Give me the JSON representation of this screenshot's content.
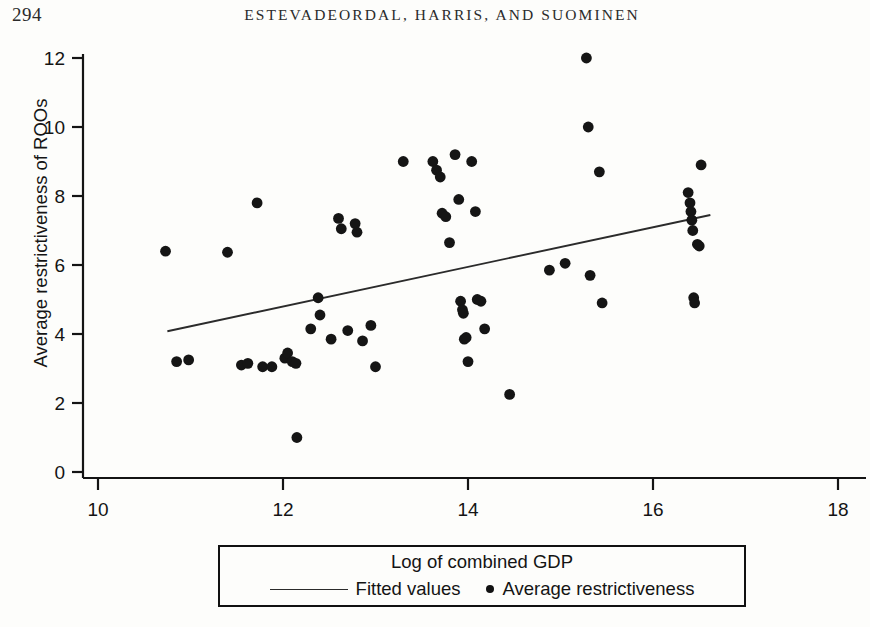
{
  "header": {
    "folio": "294",
    "running_title": "ESTEVADEORDAL, HARRIS, AND SUOMINEN"
  },
  "legend": {
    "title": "Log of combined GDP",
    "fitted_label": "Fitted values",
    "points_label": "Average restrictiveness"
  },
  "axes": {
    "y_title": "Average restrictiveness of ROOs"
  },
  "colors": {
    "ink": "#141414",
    "marker": "#151515",
    "line": "#2b2b2b",
    "background": "#fdfdfb"
  },
  "chart_data": {
    "type": "scatter",
    "title": "",
    "xlabel": "Log of combined GDP",
    "ylabel": "Average restrictiveness of ROOs",
    "xlim": [
      10,
      18
    ],
    "ylim": [
      0,
      12
    ],
    "xticks": [
      10,
      12,
      14,
      16,
      18
    ],
    "yticks": [
      0,
      2,
      4,
      6,
      8,
      10,
      12
    ],
    "grid": false,
    "legend_position": "below-axes",
    "series": [
      {
        "name": "Average restrictiveness",
        "type": "scatter",
        "marker": "circle",
        "points": [
          [
            10.73,
            6.4
          ],
          [
            10.85,
            3.2
          ],
          [
            10.98,
            3.25
          ],
          [
            11.4,
            6.37
          ],
          [
            11.55,
            3.1
          ],
          [
            11.62,
            3.15
          ],
          [
            11.72,
            7.8
          ],
          [
            11.78,
            3.05
          ],
          [
            11.88,
            3.05
          ],
          [
            12.02,
            3.3
          ],
          [
            12.05,
            3.45
          ],
          [
            12.1,
            3.2
          ],
          [
            12.14,
            3.15
          ],
          [
            12.15,
            1.0
          ],
          [
            12.3,
            4.15
          ],
          [
            12.38,
            5.05
          ],
          [
            12.4,
            4.55
          ],
          [
            12.52,
            3.85
          ],
          [
            12.6,
            7.35
          ],
          [
            12.63,
            7.05
          ],
          [
            12.7,
            4.1
          ],
          [
            12.78,
            7.2
          ],
          [
            12.8,
            6.95
          ],
          [
            12.86,
            3.8
          ],
          [
            12.95,
            4.25
          ],
          [
            13.0,
            3.05
          ],
          [
            13.3,
            9.0
          ],
          [
            13.62,
            9.0
          ],
          [
            13.66,
            8.75
          ],
          [
            13.7,
            8.55
          ],
          [
            13.72,
            7.5
          ],
          [
            13.76,
            7.4
          ],
          [
            13.8,
            6.65
          ],
          [
            13.86,
            9.2
          ],
          [
            13.9,
            7.9
          ],
          [
            13.92,
            4.95
          ],
          [
            13.94,
            4.7
          ],
          [
            13.95,
            4.6
          ],
          [
            13.96,
            3.85
          ],
          [
            13.98,
            3.9
          ],
          [
            14.0,
            3.2
          ],
          [
            14.04,
            9.0
          ],
          [
            14.08,
            7.55
          ],
          [
            14.1,
            5.0
          ],
          [
            14.14,
            4.95
          ],
          [
            14.18,
            4.15
          ],
          [
            14.45,
            2.25
          ],
          [
            14.88,
            5.85
          ],
          [
            15.05,
            6.05
          ],
          [
            15.28,
            12.0
          ],
          [
            15.3,
            10.0
          ],
          [
            15.32,
            5.7
          ],
          [
            15.42,
            8.7
          ],
          [
            15.45,
            4.9
          ],
          [
            16.38,
            8.1
          ],
          [
            16.4,
            7.8
          ],
          [
            16.41,
            7.55
          ],
          [
            16.42,
            7.3
          ],
          [
            16.43,
            7.0
          ],
          [
            16.48,
            6.6
          ],
          [
            16.5,
            6.55
          ],
          [
            16.44,
            5.05
          ],
          [
            16.45,
            4.9
          ],
          [
            16.52,
            8.9
          ]
        ]
      },
      {
        "name": "Fitted values",
        "type": "line",
        "endpoints": [
          [
            10.75,
            4.08
          ],
          [
            16.62,
            7.45
          ]
        ]
      }
    ]
  }
}
